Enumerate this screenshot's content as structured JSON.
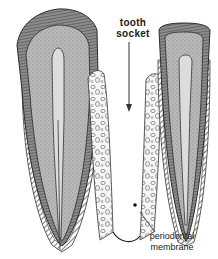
{
  "diagram": {
    "labels": {
      "tooth_socket_line1": "tooth",
      "tooth_socket_line2": "socket",
      "periodontal_line1": "periodontal",
      "periodontal_line2": "membrane"
    },
    "colors": {
      "enamel": "#6e6e6e",
      "dentin": "#b9b9b9",
      "pulp": "#dcdcdc",
      "bone": "#f4f4f4",
      "outline": "#2a2a2a",
      "background": "#ffffff"
    },
    "structures": [
      "left tooth (incisor)",
      "right tooth",
      "alveolar bone",
      "tooth socket",
      "periodontal membrane"
    ]
  }
}
